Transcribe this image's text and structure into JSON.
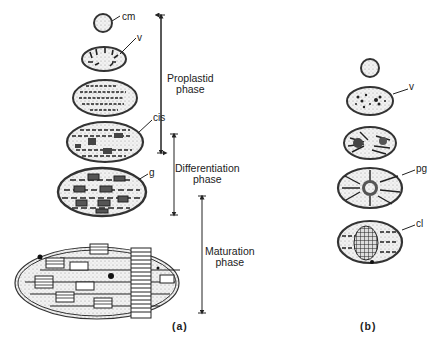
{
  "figure": {
    "panel_a": {
      "label": "(a)",
      "structure_labels": {
        "cm": "cm",
        "v": "v",
        "cis": "cis",
        "g": "g"
      },
      "phases": [
        {
          "line1": "Proplastid",
          "line2": "phase"
        },
        {
          "line1": "Differentiation",
          "line2": "phase"
        },
        {
          "line1": "Maturation",
          "line2": "phase"
        }
      ]
    },
    "panel_b": {
      "label": "(b)",
      "structure_labels": {
        "v": "v",
        "pg": "pg",
        "cl": "cl"
      }
    }
  }
}
